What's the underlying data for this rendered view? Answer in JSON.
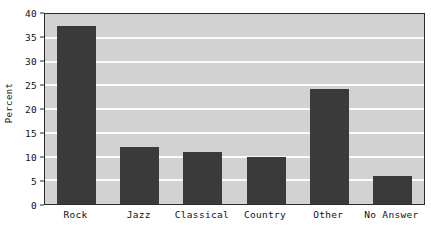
{
  "chart_data": {
    "type": "bar",
    "title": "",
    "xlabel": "",
    "ylabel": "Percent",
    "categories": [
      "Rock",
      "Jazz",
      "Classical",
      "Country",
      "Other",
      "No Answer"
    ],
    "values": [
      37.5,
      12.0,
      11.0,
      9.8,
      24.3,
      6.0
    ],
    "ylim": [
      0,
      40
    ],
    "ytick_labels": [
      "0",
      "5",
      "10",
      "15",
      "20",
      "25",
      "30",
      "35",
      "40"
    ],
    "ytick_values": [
      0,
      5,
      10,
      15,
      20,
      25,
      30,
      35,
      40
    ],
    "grid": "horizontal",
    "legend": "none",
    "colors": {
      "bar": "#3a3a3a",
      "plot_background": "#d2d2d2",
      "gridline": "#fbfbfb",
      "frame": "#2b2b2b",
      "text": "#111111",
      "page_background": "#ffffff"
    }
  },
  "annotations": {
    "clipped_title_remnant": ""
  }
}
